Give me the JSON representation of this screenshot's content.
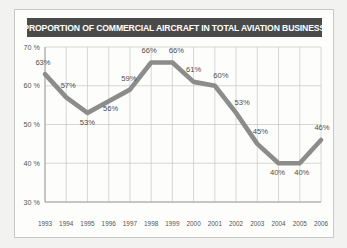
{
  "title": "PROPORTION OF COMMERCIAL AIRCRAFT IN TOTAL AVIATION BUSINESS",
  "colors": {
    "banner_bg": "#4a4a4a",
    "banner_text": "#ffffff",
    "line": "#8c8c8a",
    "grid": "#c6c6c2",
    "axis": "#9a9a96",
    "label_text": "#555552",
    "page_bg": "#f2f2f0",
    "card_bg": "#fdfdfc"
  },
  "chart_data": {
    "type": "line",
    "title": "PROPORTION OF COMMERCIAL AIRCRAFT IN TOTAL AVIATION BUSINESS",
    "xlabel": "",
    "ylabel": "",
    "categories": [
      "1993",
      "1994",
      "1995",
      "1996",
      "1997",
      "1998",
      "1999",
      "2000",
      "2001",
      "2002",
      "2003",
      "2004",
      "2005",
      "2006"
    ],
    "values": [
      63,
      57,
      53,
      56,
      59,
      66,
      66,
      61,
      60,
      53,
      45,
      40,
      40,
      46
    ],
    "point_labels": [
      "63%",
      "57%",
      "53%",
      "56%",
      "59%",
      "66%",
      "66%",
      "61%",
      "60%",
      "53%",
      "45%",
      "40%",
      "40%",
      "46%"
    ],
    "ylim": [
      30,
      70
    ],
    "yticks": [
      30,
      40,
      50,
      60,
      70
    ],
    "ytick_labels": [
      "30 %",
      "40 %",
      "50 %",
      "60 %",
      "70 %"
    ],
    "grid": true,
    "legend": "none",
    "units": "percent"
  }
}
